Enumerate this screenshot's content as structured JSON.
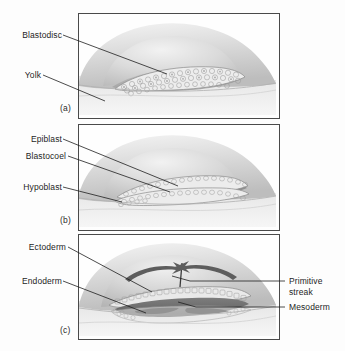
{
  "figure": {
    "background_color": "#fdfdfd",
    "border_color": "#4a4a4a",
    "label_color": "#1e1e1e",
    "yolk_color": "#cfcfcf",
    "cell_color": "#e8e8e8",
    "mesoderm_color": "#6f6f6f",
    "arrow_color": "#5a5a5a"
  },
  "panels": [
    {
      "id": "a",
      "stage_letter": "(a)",
      "labels_left": [
        {
          "text": "Blastodisc"
        },
        {
          "text": "Yolk"
        }
      ],
      "labels_right": []
    },
    {
      "id": "b",
      "stage_letter": "(b)",
      "labels_left": [
        {
          "text": "Epiblast"
        },
        {
          "text": "Blastocoel"
        },
        {
          "text": "Hypoblast"
        }
      ],
      "labels_right": []
    },
    {
      "id": "c",
      "stage_letter": "(c)",
      "labels_left": [
        {
          "text": "Ectoderm"
        },
        {
          "text": "Endoderm"
        }
      ],
      "labels_right": [
        {
          "line1": "Primitive",
          "line2": "streak"
        },
        {
          "line1": "Mesoderm",
          "line2": ""
        }
      ]
    }
  ]
}
